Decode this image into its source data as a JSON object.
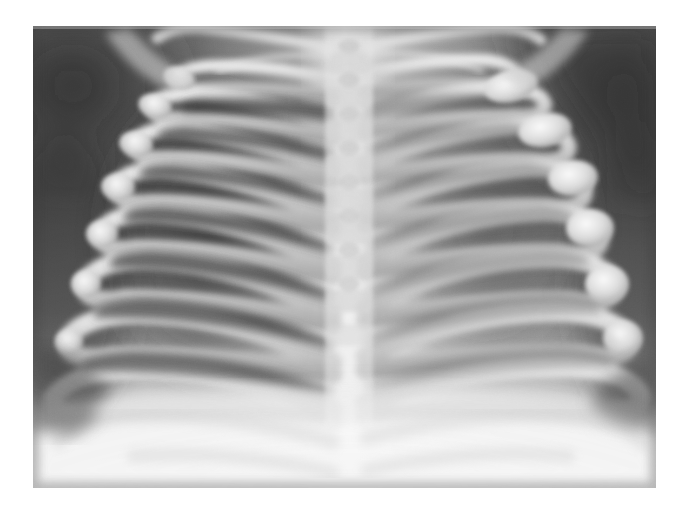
{
  "page": {
    "background_color": "#ffffff",
    "width": 686,
    "height": 508,
    "title": "Chest Radiograph"
  },
  "radiograph": {
    "name": "pediatric-chest-xray",
    "modality": "X-ray",
    "view": "AP (anteroposterior) chest",
    "subject": "infant thorax",
    "alt_text": "Grayscale anteroposterior chest radiograph of an infant showing the thoracic spine, bilateral rib cages with flared costochondral ends, clavicles and lung fields.",
    "frame": {
      "x": 33,
      "y": 26,
      "width": 623,
      "height": 462
    },
    "palette": {
      "background_dark": "#3c3c3c",
      "soft_tissue_dark": "#565656",
      "lung_field": "#4a4a4a",
      "lung_field_deep": "#3f3f3f",
      "mid_tissue": "#8a8a8a",
      "rib_bone": "#c9c9c9",
      "bone_bright": "#e2e2e2",
      "mediastinum": "#ededed",
      "diaphragm_bright": "#f2f2f2",
      "highlight": "#fafafa"
    },
    "anatomy": [
      {
        "id": "thoracic-spine",
        "label": "Thoracic spine / vertebral column",
        "region": "center",
        "brightness": "high"
      },
      {
        "id": "mediastinum",
        "label": "Mediastinum and cardiac silhouette",
        "region": "center-lower",
        "brightness": "high"
      },
      {
        "id": "left-clavicle",
        "label": "Left clavicle",
        "region": "upper-left",
        "brightness": "high"
      },
      {
        "id": "right-clavicle",
        "label": "Right clavicle",
        "region": "upper-right",
        "brightness": "high"
      },
      {
        "id": "left-ribs",
        "label": "Left rib cage (image left)",
        "region": "left",
        "rib_count": 8
      },
      {
        "id": "right-ribs",
        "label": "Right rib cage (image right)",
        "region": "right",
        "rib_count": 8
      },
      {
        "id": "left-lung-field",
        "label": "Left lung field",
        "region": "left",
        "brightness": "low"
      },
      {
        "id": "right-lung-field",
        "label": "Right lung field",
        "region": "right",
        "brightness": "low"
      },
      {
        "id": "costochondral-junctions",
        "label": "Flared bulbous costochondral junctions",
        "region": "right-lateral",
        "brightness": "very high"
      },
      {
        "id": "diaphragm",
        "label": "Diaphragm / upper abdomen",
        "region": "lower",
        "brightness": "very high"
      },
      {
        "id": "soft-tissue-shoulders",
        "label": "Shoulder soft tissue shadow",
        "region": "upper corners",
        "brightness": "low"
      }
    ],
    "left_ribs": [
      {
        "index": 1,
        "y_medial": 52,
        "y_lateral": 38,
        "x_medial": 300,
        "x_lateral": 150,
        "thickness": 13
      },
      {
        "index": 2,
        "y_medial": 95,
        "y_lateral": 62,
        "x_medial": 300,
        "x_lateral": 122,
        "thickness": 15
      },
      {
        "index": 3,
        "y_medial": 140,
        "y_lateral": 100,
        "x_medial": 300,
        "x_lateral": 100,
        "thickness": 16
      },
      {
        "index": 4,
        "y_medial": 188,
        "y_lateral": 142,
        "x_medial": 300,
        "x_lateral": 80,
        "thickness": 17
      },
      {
        "index": 5,
        "y_medial": 236,
        "y_lateral": 188,
        "x_medial": 300,
        "x_lateral": 62,
        "thickness": 18
      },
      {
        "index": 6,
        "y_medial": 284,
        "y_lateral": 238,
        "x_medial": 300,
        "x_lateral": 44,
        "thickness": 19
      },
      {
        "index": 7,
        "y_medial": 332,
        "y_lateral": 292,
        "x_medial": 300,
        "x_lateral": 26,
        "thickness": 20
      },
      {
        "index": 8,
        "y_medial": 380,
        "y_lateral": 348,
        "x_medial": 300,
        "x_lateral": 10,
        "thickness": 20
      }
    ],
    "right_ribs": [
      {
        "index": 1,
        "y_medial": 46,
        "y_lateral": 30,
        "x_medial": 330,
        "x_lateral": 470,
        "thickness": 13
      },
      {
        "index": 2,
        "y_medial": 88,
        "y_lateral": 58,
        "x_medial": 330,
        "x_lateral": 500,
        "thickness": 15
      },
      {
        "index": 3,
        "y_medial": 134,
        "y_lateral": 98,
        "x_medial": 330,
        "x_lateral": 525,
        "thickness": 16
      },
      {
        "index": 4,
        "y_medial": 182,
        "y_lateral": 142,
        "x_medial": 330,
        "x_lateral": 545,
        "thickness": 17
      },
      {
        "index": 5,
        "y_medial": 230,
        "y_lateral": 192,
        "x_medial": 330,
        "x_lateral": 562,
        "thickness": 18
      },
      {
        "index": 6,
        "y_medial": 278,
        "y_lateral": 246,
        "x_medial": 330,
        "x_lateral": 578,
        "thickness": 19
      },
      {
        "index": 7,
        "y_medial": 326,
        "y_lateral": 300,
        "x_medial": 330,
        "x_lateral": 592,
        "thickness": 20
      },
      {
        "index": 8,
        "y_medial": 374,
        "y_lateral": 352,
        "x_medial": 330,
        "x_lateral": 604,
        "thickness": 20
      }
    ],
    "vertebrae": [
      {
        "index": 1,
        "y": 36
      },
      {
        "index": 2,
        "y": 70
      },
      {
        "index": 3,
        "y": 104
      },
      {
        "index": 4,
        "y": 138
      },
      {
        "index": 5,
        "y": 172
      },
      {
        "index": 6,
        "y": 206
      },
      {
        "index": 7,
        "y": 240
      },
      {
        "index": 8,
        "y": 274
      },
      {
        "index": 9,
        "y": 308
      },
      {
        "index": 10,
        "y": 342
      }
    ],
    "costal_bulbs": [
      {
        "cx": 478,
        "cy": 68,
        "rx": 26,
        "ry": 17
      },
      {
        "cx": 516,
        "cy": 112,
        "rx": 26,
        "ry": 18
      },
      {
        "cx": 543,
        "cy": 162,
        "rx": 25,
        "ry": 19
      },
      {
        "cx": 560,
        "cy": 212,
        "rx": 24,
        "ry": 19
      },
      {
        "cx": 578,
        "cy": 268,
        "rx": 22,
        "ry": 19
      },
      {
        "cx": 592,
        "cy": 322,
        "rx": 20,
        "ry": 18
      }
    ]
  }
}
